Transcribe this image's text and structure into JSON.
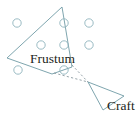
{
  "figure": {
    "width": 140,
    "height": 123,
    "background_color": "#ffffff",
    "stroke_color": "#6f9ba5",
    "dash_color": "#9aa7ad",
    "text_color": "#231f20",
    "labels": {
      "frustum": "Frustum",
      "craft": "Craft"
    },
    "shapes": {
      "frustum_polygon": {
        "name": "frustum-polygon",
        "points": "62,7 72,67 52,74 7,58",
        "stroke": "#6f9ba5",
        "stroke_width": 0.9,
        "fill": "none"
      },
      "craft_polygon": {
        "name": "craft-polygon",
        "points": "88,82 124,96 103,110",
        "stroke": "#6f9ba5",
        "stroke_width": 0.9,
        "fill": "none"
      },
      "sight_line_upper": {
        "name": "sight-line-upper",
        "x1": 72,
        "y1": 65,
        "x2": 88,
        "y2": 82,
        "stroke": "#8b9aa0",
        "dash": "2.2 2.2"
      },
      "sight_line_lower": {
        "name": "sight-line-lower",
        "x1": 54,
        "y1": 73,
        "x2": 88,
        "y2": 82,
        "stroke": "#8b9aa0",
        "dash": "2.2 2.2"
      }
    },
    "markers": {
      "radius": 4.2,
      "stroke": "#8fb3bc",
      "stroke_width": 0.9,
      "fill": "none",
      "points": [
        {
          "id": "marker-1",
          "cx": 17,
          "cy": 23
        },
        {
          "id": "marker-2",
          "cx": 64,
          "cy": 23
        },
        {
          "id": "marker-3",
          "cx": 89,
          "cy": 23
        },
        {
          "id": "marker-4",
          "cx": 41,
          "cy": 45
        },
        {
          "id": "marker-5",
          "cx": 64,
          "cy": 45
        },
        {
          "id": "marker-6",
          "cx": 89,
          "cy": 45
        },
        {
          "id": "marker-7",
          "cx": 18,
          "cy": 70
        },
        {
          "id": "marker-8",
          "cx": 64,
          "cy": 70
        }
      ]
    }
  }
}
